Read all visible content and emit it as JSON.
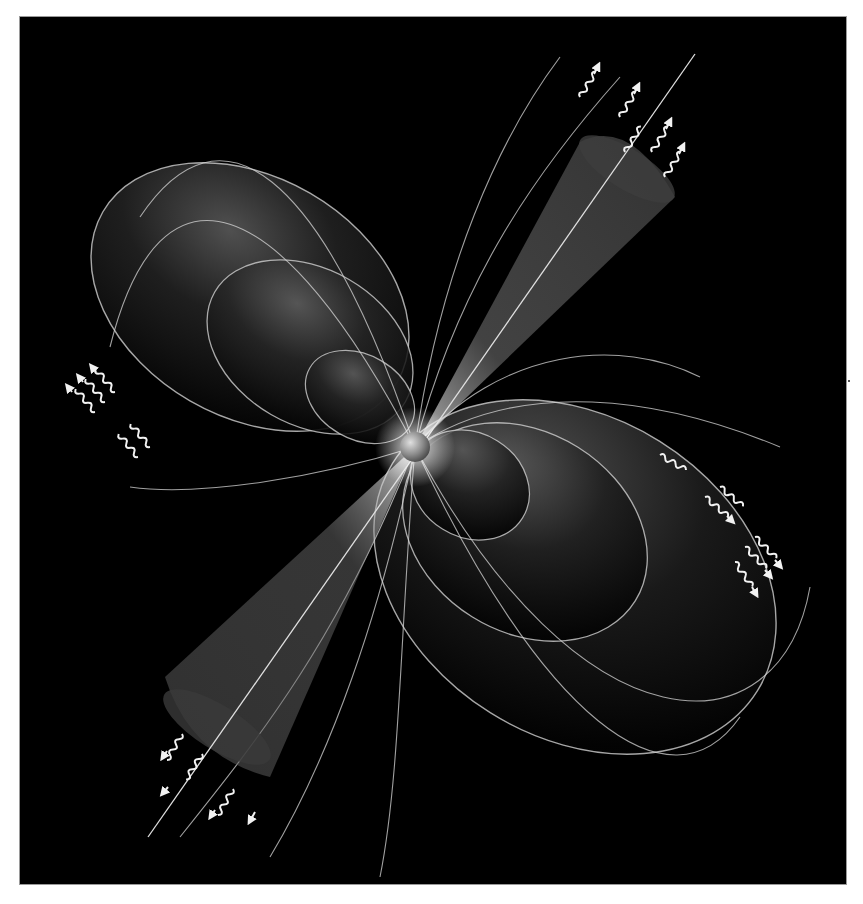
{
  "figure": {
    "subject": "Pulsar illustration",
    "colors": {
      "page_background": "#ffffff",
      "panel_background": "#000000",
      "field_line": "#d8d8d8",
      "lobe_fill": "#4a4a4a",
      "beam_fill": "#6a6a6a",
      "star": "#9a9a9a",
      "arrow": "#f2f2f2"
    },
    "panel": {
      "x": 20,
      "y": 17,
      "width": 826,
      "height": 867
    },
    "star": {
      "cx": 395,
      "cy": 430,
      "r": 14
    },
    "axis": {
      "angle_deg": -58,
      "x1": 128,
      "y1": 820,
      "x2": 675,
      "y2": 37
    },
    "beams": [
      {
        "name": "upper-beam",
        "tip": [
          395,
          430
        ],
        "end_center": [
          630,
          150
        ],
        "end_radius": 55
      },
      {
        "name": "lower-beam",
        "tip": [
          395,
          430
        ],
        "end_center": [
          195,
          700
        ],
        "end_radius": 60
      }
    ],
    "lobes": [
      {
        "name": "upper-left-large",
        "cx": 240,
        "cy": 290,
        "rx": 160,
        "ry": 110,
        "rot": 35
      },
      {
        "name": "upper-left-mid",
        "cx": 300,
        "cy": 330,
        "rx": 105,
        "ry": 72,
        "rot": 35
      },
      {
        "name": "upper-left-small",
        "cx": 345,
        "cy": 380,
        "rx": 55,
        "ry": 40,
        "rot": 35
      },
      {
        "name": "lower-right-small",
        "cx": 455,
        "cy": 470,
        "rx": 60,
        "ry": 50,
        "rot": 35
      },
      {
        "name": "lower-right-mid",
        "cx": 510,
        "cy": 520,
        "rx": 125,
        "ry": 95,
        "rot": 35
      },
      {
        "name": "lower-right-large",
        "cx": 560,
        "cy": 560,
        "rx": 205,
        "ry": 150,
        "rot": 35
      }
    ],
    "radiation_groups": [
      {
        "name": "top-right-radiation",
        "count": 5
      },
      {
        "name": "left-radiation",
        "count": 5
      },
      {
        "name": "right-radiation",
        "count": 6
      },
      {
        "name": "bottom-left-radiation",
        "count": 4
      }
    ]
  }
}
